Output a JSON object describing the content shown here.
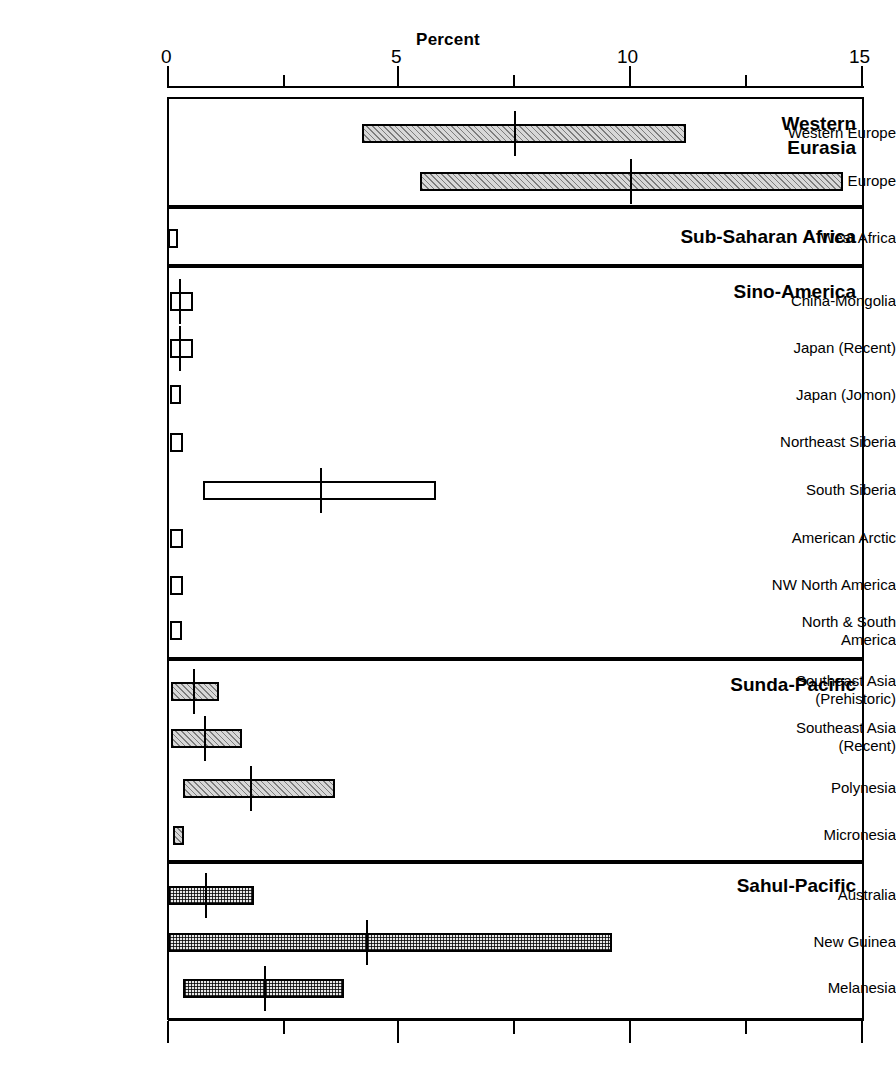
{
  "chart_data": {
    "type": "bar",
    "title": "Percent",
    "xlabel": "Percent",
    "ylabel": "",
    "xlim": [
      0,
      15
    ],
    "xticks": [
      0,
      5,
      10,
      15
    ],
    "xtick_labels": [
      "0",
      "5",
      "10",
      "15"
    ],
    "minor_ticks": [
      2.5,
      7.5,
      12.5
    ],
    "grid": false,
    "legend": "none",
    "orientation": "horizontal",
    "note": "Horizontal floating bars show range (min to max) per population; vertical line marks the central/median value.",
    "groups": [
      {
        "name": "Western Eurasia",
        "label": "Western\nEurasia",
        "label_line1": "Western",
        "label_line2": "Eurasia",
        "fill": "diagonal-hatch",
        "rows": [
          {
            "category": "Western Europe",
            "low": 4.2,
            "high": 11.2,
            "median": 7.5
          },
          {
            "category": "Northern Europe",
            "low": 5.45,
            "high": 14.6,
            "median": 10.0
          }
        ]
      },
      {
        "name": "Sub-Saharan Africa",
        "label_line1": "Sub-Saharan Africa",
        "fill": "open",
        "rows": [
          {
            "category": "West Africa",
            "low": 0.0,
            "high": 0.2,
            "median": null
          }
        ]
      },
      {
        "name": "Sino-America",
        "label_line1": "Sino-America",
        "fill": "open",
        "rows": [
          {
            "category": "China-Mongolia",
            "low": 0.05,
            "high": 0.55,
            "median": 0.25
          },
          {
            "category": "Japan (Recent)",
            "low": 0.05,
            "high": 0.55,
            "median": 0.25
          },
          {
            "category": "Japan (Jomon)",
            "low": 0.05,
            "high": 0.28,
            "median": null
          },
          {
            "category": "Northeast Siberia",
            "low": 0.05,
            "high": 0.33,
            "median": null
          },
          {
            "category": "South Siberia",
            "low": 0.75,
            "high": 5.8,
            "median": 3.3
          },
          {
            "category": "American Arctic",
            "low": 0.05,
            "high": 0.33,
            "median": null
          },
          {
            "category": "NW North America",
            "low": 0.05,
            "high": 0.33,
            "median": null
          },
          {
            "category": "North & South America",
            "low": 0.05,
            "high": 0.3,
            "median": null
          }
        ]
      },
      {
        "name": "Sunda-Pacific",
        "label_line1": "Sunda-Pacific",
        "fill": "diagonal-hatch",
        "rows": [
          {
            "category": "Southeast Asia (Prehistoric)",
            "cat_line1": "Southeast Asia",
            "cat_line2": "(Prehistoric)",
            "low": 0.07,
            "high": 1.1,
            "median": 0.57
          },
          {
            "category": "Southeast Asia (Recent)",
            "cat_line1": "Southeast Asia",
            "cat_line2": "(Recent)",
            "low": 0.07,
            "high": 1.6,
            "median": 0.8
          },
          {
            "category": "Polynesia",
            "low": 0.33,
            "high": 3.6,
            "median": 1.8
          },
          {
            "category": "Micronesia",
            "low": 0.1,
            "high": 0.35,
            "median": null
          }
        ]
      },
      {
        "name": "Sahul-Pacific",
        "label_line1": "Sahul-Pacific",
        "fill": "cross-grid",
        "rows": [
          {
            "category": "Australia",
            "low": 0.0,
            "high": 1.85,
            "median": 0.82
          },
          {
            "category": "New Guinea",
            "low": 0.0,
            "high": 9.6,
            "median": 4.3
          },
          {
            "category": "Melanesia",
            "low": 0.33,
            "high": 3.8,
            "median": 2.1
          }
        ]
      }
    ]
  },
  "axis": {
    "title": "Percent",
    "tick_0": "0",
    "tick_5": "5",
    "tick_10": "10",
    "tick_15": "15"
  },
  "labels": {
    "western_europe": "Western Europe",
    "northern_europe": "Northern Europe",
    "west_africa": "West Africa",
    "china_mongolia": "China-Mongolia",
    "japan_recent": "Japan (Recent)",
    "japan_jomon": "Japan (Jomon)",
    "northeast_siberia": "Northeast Siberia",
    "south_siberia": "South Siberia",
    "american_arctic": "American Arctic",
    "nw_north_america": "NW North America",
    "north_south_america_l1": "North & South",
    "north_south_america_l2": "America",
    "sea_prehistoric_l1": "Southeast Asia",
    "sea_prehistoric_l2": "(Prehistoric)",
    "sea_recent_l1": "Southeast Asia",
    "sea_recent_l2": "(Recent)",
    "polynesia": "Polynesia",
    "micronesia": "Micronesia",
    "australia": "Australia",
    "new_guinea": "New Guinea",
    "melanesia": "Melanesia"
  },
  "group_labels": {
    "western_eurasia_l1": "Western",
    "western_eurasia_l2": "Eurasia",
    "sub_saharan_africa": "Sub-Saharan Africa",
    "sino_america": "Sino-America",
    "sunda_pacific": "Sunda-Pacific",
    "sahul_pacific": "Sahul-Pacific"
  },
  "colors": {
    "ink": "#000000",
    "background": "#ffffff",
    "hatch_fill": "#d8d8d8",
    "grid_fill": "#e8e8e8"
  }
}
